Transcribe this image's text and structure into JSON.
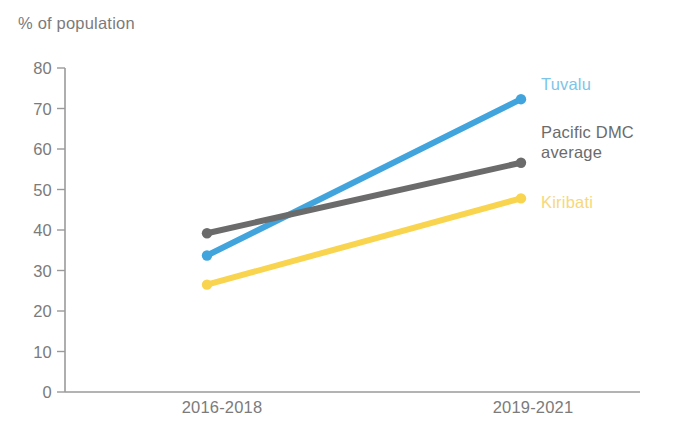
{
  "chart_data": {
    "type": "line",
    "title": "",
    "subtitle": "",
    "ylabel": "% of population",
    "xlabel": "",
    "categories": [
      "2016-2018",
      "2019-2021"
    ],
    "ylim": [
      0,
      80
    ],
    "ytick_step": 10,
    "yticks": [
      "0",
      "10",
      "20",
      "30",
      "40",
      "50",
      "60",
      "70",
      "80"
    ],
    "grid": false,
    "legend_position": "right-inline-end-of-line",
    "series": [
      {
        "name": "Tuvalu",
        "color": "#41A4DC",
        "values": [
          33.7,
          72.3
        ]
      },
      {
        "name": "Pacific DMC average",
        "color": "#6B6B6B",
        "values": [
          39.2,
          56.6
        ]
      },
      {
        "name": "Kiribati",
        "color": "#F9D44E",
        "values": [
          26.5,
          47.8
        ]
      }
    ],
    "annotations": []
  },
  "axis": {
    "color": "#9a9a9a",
    "tick_label_color": "#7b7b7b"
  },
  "legend": {
    "items": [
      {
        "label": "Tuvalu",
        "color": "#7EC4E8"
      },
      {
        "label": "Pacific DMC\naverage",
        "color": "#6B6B6B"
      },
      {
        "label": "Kiribati",
        "color": "#F7D87A"
      }
    ]
  }
}
